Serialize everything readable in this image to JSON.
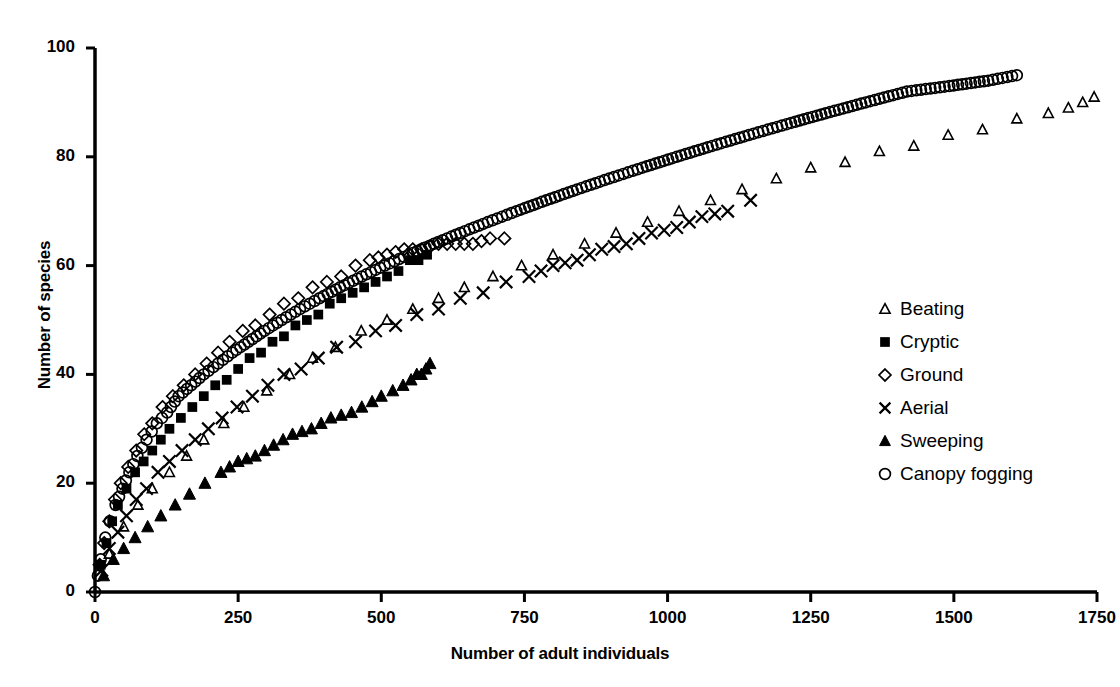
{
  "chart_data": {
    "type": "scatter",
    "title": "",
    "xlabel": "Number of adult individuals",
    "ylabel": "Number of species",
    "xlim": [
      0,
      1750
    ],
    "ylim": [
      0,
      100
    ],
    "xticks": [
      0,
      250,
      500,
      750,
      1000,
      1250,
      1500,
      1750
    ],
    "yticks": [
      0,
      20,
      40,
      60,
      80,
      100
    ],
    "xtick_labels": [
      "0",
      "250",
      "500",
      "750",
      "1000",
      "1250",
      "1500",
      "1750"
    ],
    "ytick_labels": [
      "0",
      "20",
      "40",
      "60",
      "80",
      "100"
    ],
    "grid": false,
    "legend_position": "center-right",
    "series": [
      {
        "name": "Beating",
        "marker": "open-triangle",
        "color": "#000000",
        "points": [
          [
            0,
            0
          ],
          [
            25,
            7
          ],
          [
            50,
            12
          ],
          [
            75,
            16
          ],
          [
            100,
            19
          ],
          [
            130,
            22
          ],
          [
            160,
            25
          ],
          [
            190,
            28
          ],
          [
            225,
            31
          ],
          [
            260,
            34
          ],
          [
            300,
            37
          ],
          [
            340,
            40
          ],
          [
            380,
            43
          ],
          [
            420,
            45
          ],
          [
            465,
            48
          ],
          [
            510,
            50
          ],
          [
            555,
            52
          ],
          [
            600,
            54
          ],
          [
            645,
            56
          ],
          [
            695,
            58
          ],
          [
            745,
            60
          ],
          [
            800,
            62
          ],
          [
            855,
            64
          ],
          [
            910,
            66
          ],
          [
            965,
            68
          ],
          [
            1020,
            70
          ],
          [
            1075,
            72
          ],
          [
            1130,
            74
          ],
          [
            1190,
            76
          ],
          [
            1250,
            78
          ],
          [
            1310,
            79
          ],
          [
            1370,
            81
          ],
          [
            1430,
            82
          ],
          [
            1490,
            84
          ],
          [
            1550,
            85
          ],
          [
            1610,
            87
          ],
          [
            1665,
            88
          ],
          [
            1700,
            89
          ],
          [
            1725,
            90
          ],
          [
            1745,
            91
          ]
        ]
      },
      {
        "name": "Cryptic",
        "marker": "filled-square",
        "color": "#000000",
        "points": [
          [
            0,
            0
          ],
          [
            10,
            5
          ],
          [
            20,
            9
          ],
          [
            30,
            13
          ],
          [
            40,
            16
          ],
          [
            55,
            19
          ],
          [
            70,
            22
          ],
          [
            85,
            24
          ],
          [
            100,
            26
          ],
          [
            115,
            28
          ],
          [
            130,
            30
          ],
          [
            150,
            32
          ],
          [
            170,
            34
          ],
          [
            190,
            36
          ],
          [
            210,
            38
          ],
          [
            230,
            39
          ],
          [
            250,
            41
          ],
          [
            270,
            43
          ],
          [
            290,
            44
          ],
          [
            310,
            46
          ],
          [
            330,
            47
          ],
          [
            350,
            49
          ],
          [
            370,
            50
          ],
          [
            390,
            51
          ],
          [
            410,
            53
          ],
          [
            430,
            54
          ],
          [
            450,
            55
          ],
          [
            470,
            56
          ],
          [
            490,
            57
          ],
          [
            510,
            58
          ],
          [
            530,
            59
          ],
          [
            550,
            61
          ],
          [
            565,
            61
          ],
          [
            580,
            62
          ]
        ]
      },
      {
        "name": "Ground",
        "marker": "open-diamond",
        "color": "#000000",
        "points": [
          [
            0,
            0
          ],
          [
            8,
            5
          ],
          [
            16,
            9
          ],
          [
            25,
            13
          ],
          [
            35,
            17
          ],
          [
            45,
            20
          ],
          [
            58,
            23
          ],
          [
            72,
            26
          ],
          [
            86,
            29
          ],
          [
            100,
            31
          ],
          [
            118,
            34
          ],
          [
            136,
            36
          ],
          [
            155,
            38
          ],
          [
            175,
            40
          ],
          [
            195,
            42
          ],
          [
            215,
            44
          ],
          [
            235,
            46
          ],
          [
            258,
            48
          ],
          [
            280,
            49
          ],
          [
            305,
            51
          ],
          [
            330,
            53
          ],
          [
            355,
            54
          ],
          [
            380,
            56
          ],
          [
            405,
            57
          ],
          [
            430,
            58
          ],
          [
            455,
            60
          ],
          [
            480,
            61
          ],
          [
            510,
            62
          ],
          [
            540,
            63
          ],
          [
            570,
            63
          ],
          [
            600,
            64
          ],
          [
            630,
            64
          ],
          [
            660,
            64
          ],
          [
            690,
            65
          ],
          [
            715,
            65
          ]
        ]
      },
      {
        "name": "Aerial",
        "marker": "cross",
        "color": "#000000",
        "points": [
          [
            0,
            0
          ],
          [
            12,
            4
          ],
          [
            25,
            8
          ],
          [
            40,
            11
          ],
          [
            55,
            14
          ],
          [
            72,
            17
          ],
          [
            90,
            19
          ],
          [
            110,
            22
          ],
          [
            130,
            24
          ],
          [
            152,
            26
          ],
          [
            175,
            28
          ],
          [
            198,
            30
          ],
          [
            222,
            32
          ],
          [
            248,
            34
          ],
          [
            275,
            36
          ],
          [
            302,
            38
          ],
          [
            330,
            40
          ],
          [
            360,
            41
          ],
          [
            390,
            43
          ],
          [
            422,
            45
          ],
          [
            455,
            46
          ],
          [
            490,
            48
          ],
          [
            525,
            49
          ],
          [
            562,
            51
          ],
          [
            600,
            52
          ],
          [
            638,
            54
          ],
          [
            678,
            55
          ],
          [
            718,
            57
          ],
          [
            758,
            58
          ],
          [
            800,
            60
          ],
          [
            842,
            61
          ],
          [
            885,
            63
          ],
          [
            928,
            64
          ],
          [
            972,
            66
          ],
          [
            1016,
            67
          ],
          [
            1060,
            69
          ],
          [
            1105,
            70
          ],
          [
            1145,
            72
          ]
        ]
      },
      {
        "name": "Sweeping",
        "marker": "filled-triangle",
        "color": "#000000",
        "points": [
          [
            0,
            0
          ],
          [
            15,
            3
          ],
          [
            32,
            6
          ],
          [
            50,
            8
          ],
          [
            70,
            10
          ],
          [
            92,
            12
          ],
          [
            115,
            14
          ],
          [
            140,
            16
          ],
          [
            165,
            18
          ],
          [
            192,
            20
          ],
          [
            220,
            22
          ],
          [
            250,
            24
          ],
          [
            280,
            25
          ],
          [
            312,
            27
          ],
          [
            345,
            29
          ],
          [
            378,
            30
          ],
          [
            412,
            32
          ],
          [
            448,
            33
          ],
          [
            484,
            35
          ],
          [
            500,
            36
          ],
          [
            520,
            37
          ],
          [
            538,
            38
          ],
          [
            552,
            39
          ],
          [
            562,
            40
          ],
          [
            570,
            40
          ],
          [
            578,
            41
          ],
          [
            585,
            42
          ]
        ]
      },
      {
        "name": "Canopy fogging",
        "marker": "open-circle",
        "color": "#000000",
        "points": [
          [
            0,
            0
          ],
          [
            5,
            3
          ],
          [
            10,
            6
          ],
          [
            18,
            10
          ],
          [
            26,
            13
          ],
          [
            36,
            16
          ],
          [
            48,
            19
          ],
          [
            60,
            22
          ],
          [
            74,
            25
          ],
          [
            90,
            28
          ],
          [
            108,
            31
          ],
          [
            126,
            33
          ],
          [
            146,
            36
          ],
          [
            168,
            38
          ],
          [
            190,
            40
          ],
          [
            215,
            42
          ],
          [
            240,
            44
          ],
          [
            268,
            46
          ],
          [
            296,
            48
          ],
          [
            326,
            50
          ],
          [
            358,
            52
          ],
          [
            392,
            54
          ],
          [
            428,
            56
          ],
          [
            466,
            58
          ],
          [
            506,
            60
          ],
          [
            548,
            62
          ],
          [
            592,
            64
          ],
          [
            638,
            66
          ],
          [
            686,
            68
          ],
          [
            736,
            70
          ],
          [
            788,
            72
          ],
          [
            842,
            74
          ],
          [
            898,
            76
          ],
          [
            956,
            78
          ],
          [
            1016,
            80
          ],
          [
            1078,
            82
          ],
          [
            1142,
            84
          ],
          [
            1208,
            86
          ],
          [
            1276,
            88
          ],
          [
            1346,
            90
          ],
          [
            1418,
            92
          ],
          [
            1492,
            93
          ],
          [
            1560,
            94
          ],
          [
            1610,
            95
          ]
        ]
      }
    ]
  },
  "legend": {
    "items": [
      {
        "label": "Beating",
        "marker": "open-triangle"
      },
      {
        "label": "Cryptic",
        "marker": "filled-square"
      },
      {
        "label": "Ground",
        "marker": "open-diamond"
      },
      {
        "label": "Aerial",
        "marker": "cross"
      },
      {
        "label": "Sweeping",
        "marker": "filled-triangle"
      },
      {
        "label": "Canopy fogging",
        "marker": "open-circle"
      }
    ]
  },
  "colors": {
    "ink": "#000000",
    "background": "#ffffff"
  }
}
